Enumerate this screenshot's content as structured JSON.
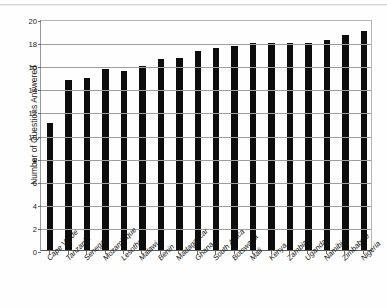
{
  "chart_data": {
    "type": "bar",
    "title": "",
    "subtitle": "",
    "xlabel": "",
    "ylabel": "Number of Questions Answered",
    "ylim": [
      0,
      20
    ],
    "ytick_step": 2,
    "yticks": [
      "0",
      "2",
      "4",
      "6",
      "8",
      "10",
      "12",
      "14",
      "16",
      "18",
      "20"
    ],
    "grid": true,
    "legend": false,
    "legend_position": "none",
    "bar_color": "#0d0d0d",
    "categories": [
      "Cape Verde",
      "Tanzania",
      "Senegal",
      "Mozambique",
      "Lesotho",
      "Malawi",
      "Benin",
      "Madagascar",
      "Ghana",
      "South Africa",
      "Botswana",
      "Mali",
      "Kenya",
      "Zambia",
      "Uganda",
      "Namibia",
      "Zimbabwe",
      "Nigeria"
    ],
    "values": [
      11.0,
      14.7,
      14.9,
      15.7,
      15.5,
      15.9,
      16.5,
      16.6,
      17.2,
      17.5,
      17.7,
      17.9,
      17.9,
      17.9,
      17.9,
      18.2,
      18.6,
      19.0
    ]
  }
}
